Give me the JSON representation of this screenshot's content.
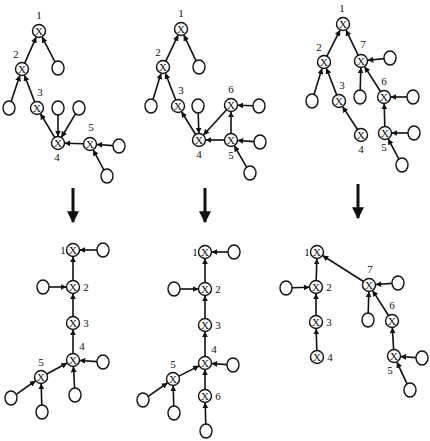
{
  "style": {
    "stroke": "#111111",
    "fill": "#ffffff",
    "node_r": 6.5,
    "leaf_rx": 6,
    "leaf_ry": 7,
    "node_glyph": "X"
  },
  "panels": [
    {
      "id": "top-1",
      "nodes": [
        {
          "id": "n1",
          "x": 39,
          "y": 31,
          "label": "1",
          "lx": 39,
          "ly": 19
        },
        {
          "id": "n2",
          "x": 22,
          "y": 69,
          "label": "2",
          "lx": 16,
          "ly": 58
        },
        {
          "id": "n3",
          "x": 37,
          "y": 108,
          "label": "3",
          "lx": 40,
          "ly": 96
        },
        {
          "id": "n4",
          "x": 58,
          "y": 143,
          "label": "4",
          "lx": 57,
          "ly": 161
        },
        {
          "id": "n5",
          "x": 90,
          "y": 144,
          "label": "5",
          "lx": 91,
          "ly": 131
        }
      ],
      "leaves": [
        {
          "id": "a",
          "x": 58,
          "y": 68
        },
        {
          "id": "b",
          "x": 9,
          "y": 108
        },
        {
          "id": "c",
          "x": 58,
          "y": 108
        },
        {
          "id": "d",
          "x": 79,
          "y": 108
        },
        {
          "id": "e",
          "x": 119,
          "y": 146
        },
        {
          "id": "f",
          "x": 107,
          "y": 176
        }
      ],
      "edges": [
        [
          "n2",
          "n1"
        ],
        [
          "a",
          "n1"
        ],
        [
          "b",
          "n2"
        ],
        [
          "n3",
          "n2"
        ],
        [
          "n4",
          "n3"
        ],
        [
          "c",
          "n4"
        ],
        [
          "d",
          "n4"
        ],
        [
          "n5",
          "n4"
        ],
        [
          "e",
          "n5"
        ],
        [
          "f",
          "n5"
        ]
      ]
    },
    {
      "id": "top-2",
      "nodes": [
        {
          "id": "n1",
          "x": 181,
          "y": 29,
          "label": "1",
          "lx": 181,
          "ly": 17
        },
        {
          "id": "n2",
          "x": 163,
          "y": 67,
          "label": "2",
          "lx": 158,
          "ly": 56
        },
        {
          "id": "n3",
          "x": 178,
          "y": 106,
          "label": "3",
          "lx": 181,
          "ly": 94
        },
        {
          "id": "n4",
          "x": 199,
          "y": 140,
          "label": "4",
          "lx": 199,
          "ly": 158
        },
        {
          "id": "n5",
          "x": 231,
          "y": 140,
          "label": "5",
          "lx": 231,
          "ly": 159
        },
        {
          "id": "n6",
          "x": 231,
          "y": 105,
          "label": "6",
          "lx": 231,
          "ly": 93
        }
      ],
      "leaves": [
        {
          "id": "a",
          "x": 199,
          "y": 67
        },
        {
          "id": "b",
          "x": 151,
          "y": 106
        },
        {
          "id": "c",
          "x": 198,
          "y": 106
        },
        {
          "id": "d",
          "x": 259,
          "y": 106
        },
        {
          "id": "e",
          "x": 260,
          "y": 142
        },
        {
          "id": "f",
          "x": 250,
          "y": 173
        }
      ],
      "edges": [
        [
          "n2",
          "n1"
        ],
        [
          "a",
          "n1"
        ],
        [
          "b",
          "n2"
        ],
        [
          "n3",
          "n2"
        ],
        [
          "n4",
          "n3"
        ],
        [
          "c",
          "n4"
        ],
        [
          "n6",
          "n4"
        ],
        [
          "n5",
          "n4"
        ],
        [
          "d",
          "n6"
        ],
        [
          "n5",
          "n6"
        ],
        [
          "e",
          "n5"
        ],
        [
          "f",
          "n5"
        ]
      ]
    },
    {
      "id": "top-3",
      "nodes": [
        {
          "id": "n1",
          "x": 343,
          "y": 24,
          "label": "1",
          "lx": 342,
          "ly": 12
        },
        {
          "id": "n2",
          "x": 324,
          "y": 62,
          "label": "2",
          "lx": 319,
          "ly": 51
        },
        {
          "id": "n3",
          "x": 339,
          "y": 101,
          "label": "3",
          "lx": 342,
          "ly": 89
        },
        {
          "id": "n4",
          "x": 361,
          "y": 135,
          "label": "4",
          "lx": 361,
          "ly": 153
        },
        {
          "id": "n7",
          "x": 361,
          "y": 61,
          "label": "7",
          "lx": 363,
          "ly": 48
        },
        {
          "id": "n6",
          "x": 384,
          "y": 97,
          "label": "6",
          "lx": 384,
          "ly": 85
        },
        {
          "id": "n5",
          "x": 385,
          "y": 133,
          "label": "5",
          "lx": 384,
          "ly": 151
        }
      ],
      "leaves": [
        {
          "id": "a",
          "x": 390,
          "y": 58
        },
        {
          "id": "b",
          "x": 360,
          "y": 97
        },
        {
          "id": "c",
          "x": 312,
          "y": 101
        },
        {
          "id": "d",
          "x": 413,
          "y": 97
        },
        {
          "id": "e",
          "x": 414,
          "y": 133
        },
        {
          "id": "f",
          "x": 402,
          "y": 165
        }
      ],
      "edges": [
        [
          "n2",
          "n1"
        ],
        [
          "n7",
          "n1"
        ],
        [
          "c",
          "n2"
        ],
        [
          "n3",
          "n2"
        ],
        [
          "n4",
          "n3"
        ],
        [
          "a",
          "n7"
        ],
        [
          "b",
          "n7"
        ],
        [
          "n6",
          "n7"
        ],
        [
          "d",
          "n6"
        ],
        [
          "n5",
          "n6"
        ],
        [
          "e",
          "n5"
        ],
        [
          "f",
          "n5"
        ]
      ]
    },
    {
      "id": "bottom-1",
      "nodes": [
        {
          "id": "n1",
          "x": 73,
          "y": 250,
          "label": "1",
          "lx": 63,
          "ly": 254
        },
        {
          "id": "n2",
          "x": 73,
          "y": 287,
          "label": "2",
          "lx": 86,
          "ly": 291
        },
        {
          "id": "n3",
          "x": 73,
          "y": 323,
          "label": "3",
          "lx": 86,
          "ly": 327
        },
        {
          "id": "n4",
          "x": 73,
          "y": 360,
          "label": "4",
          "lx": 82,
          "ly": 350
        },
        {
          "id": "n5",
          "x": 41,
          "y": 377,
          "label": "5",
          "lx": 41,
          "ly": 366
        }
      ],
      "leaves": [
        {
          "id": "a",
          "x": 103,
          "y": 250
        },
        {
          "id": "b",
          "x": 43,
          "y": 287
        },
        {
          "id": "c",
          "x": 103,
          "y": 362
        },
        {
          "id": "d",
          "x": 75,
          "y": 395
        },
        {
          "id": "e",
          "x": 11,
          "y": 398
        },
        {
          "id": "f",
          "x": 42,
          "y": 412
        }
      ],
      "edges": [
        [
          "a",
          "n1"
        ],
        [
          "n2",
          "n1"
        ],
        [
          "b",
          "n2"
        ],
        [
          "n3",
          "n2"
        ],
        [
          "n4",
          "n3"
        ],
        [
          "c",
          "n4"
        ],
        [
          "d",
          "n4"
        ],
        [
          "n5",
          "n4"
        ],
        [
          "e",
          "n5"
        ],
        [
          "f",
          "n5"
        ]
      ]
    },
    {
      "id": "bottom-2",
      "nodes": [
        {
          "id": "n1",
          "x": 205,
          "y": 252,
          "label": "1",
          "lx": 195,
          "ly": 256
        },
        {
          "id": "n2",
          "x": 205,
          "y": 289,
          "label": "2",
          "lx": 218,
          "ly": 293
        },
        {
          "id": "n3",
          "x": 205,
          "y": 325,
          "label": "3",
          "lx": 218,
          "ly": 329
        },
        {
          "id": "n4",
          "x": 205,
          "y": 363,
          "label": "4",
          "lx": 214,
          "ly": 353
        },
        {
          "id": "n5",
          "x": 173,
          "y": 379,
          "label": "5",
          "lx": 173,
          "ly": 368
        },
        {
          "id": "n6",
          "x": 205,
          "y": 396,
          "label": "6",
          "lx": 218,
          "ly": 400
        }
      ],
      "leaves": [
        {
          "id": "a",
          "x": 234,
          "y": 252
        },
        {
          "id": "b",
          "x": 174,
          "y": 289
        },
        {
          "id": "c",
          "x": 233,
          "y": 365
        },
        {
          "id": "d",
          "x": 143,
          "y": 400
        },
        {
          "id": "e",
          "x": 174,
          "y": 413
        },
        {
          "id": "f",
          "x": 206,
          "y": 431
        }
      ],
      "edges": [
        [
          "a",
          "n1"
        ],
        [
          "n2",
          "n1"
        ],
        [
          "b",
          "n2"
        ],
        [
          "n3",
          "n2"
        ],
        [
          "n4",
          "n3"
        ],
        [
          "c",
          "n4"
        ],
        [
          "n6",
          "n4"
        ],
        [
          "n5",
          "n4"
        ],
        [
          "d",
          "n5"
        ],
        [
          "e",
          "n5"
        ],
        [
          "f",
          "n6"
        ]
      ]
    },
    {
      "id": "bottom-3",
      "nodes": [
        {
          "id": "n1",
          "x": 317,
          "y": 252,
          "label": "1",
          "lx": 307,
          "ly": 256
        },
        {
          "id": "n2",
          "x": 316,
          "y": 287,
          "label": "2",
          "lx": 329,
          "ly": 291
        },
        {
          "id": "n3",
          "x": 316,
          "y": 322,
          "label": "3",
          "lx": 329,
          "ly": 326
        },
        {
          "id": "n4",
          "x": 317,
          "y": 357,
          "label": "4",
          "lx": 330,
          "ly": 361
        },
        {
          "id": "n7",
          "x": 369,
          "y": 285,
          "label": "7",
          "lx": 370,
          "ly": 273
        },
        {
          "id": "n6",
          "x": 392,
          "y": 321,
          "label": "6",
          "lx": 392,
          "ly": 309
        },
        {
          "id": "n5",
          "x": 394,
          "y": 356,
          "label": "5",
          "lx": 390,
          "ly": 374
        }
      ],
      "leaves": [
        {
          "id": "a",
          "x": 286,
          "y": 288
        },
        {
          "id": "b",
          "x": 398,
          "y": 283
        },
        {
          "id": "c",
          "x": 368,
          "y": 320
        },
        {
          "id": "d",
          "x": 422,
          "y": 358
        },
        {
          "id": "e",
          "x": 410,
          "y": 390
        }
      ],
      "edges": [
        [
          "n2",
          "n1"
        ],
        [
          "n7",
          "n1"
        ],
        [
          "a",
          "n2"
        ],
        [
          "n3",
          "n2"
        ],
        [
          "n4",
          "n3"
        ],
        [
          "b",
          "n7"
        ],
        [
          "c",
          "n7"
        ],
        [
          "n6",
          "n7"
        ],
        [
          "n5",
          "n6"
        ],
        [
          "d",
          "n5"
        ],
        [
          "e",
          "n5"
        ]
      ]
    }
  ],
  "transform_arrows": [
    {
      "id": "arrow-1",
      "x": 73,
      "y1": 188,
      "y2": 222
    },
    {
      "id": "arrow-2",
      "x": 205,
      "y1": 188,
      "y2": 222
    },
    {
      "id": "arrow-3",
      "x": 358,
      "y1": 184,
      "y2": 218
    }
  ]
}
